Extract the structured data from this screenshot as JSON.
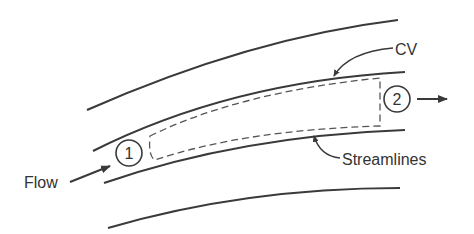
{
  "diagram": {
    "type": "control-volume-streamlines",
    "labels": {
      "cv": "CV",
      "streamlines": "Streamlines",
      "flow": "Flow",
      "section1": "1",
      "section2": "2"
    },
    "colors": {
      "line": "#3a3a3a",
      "dashed": "#555555",
      "text": "#333333",
      "background": "#ffffff"
    }
  }
}
